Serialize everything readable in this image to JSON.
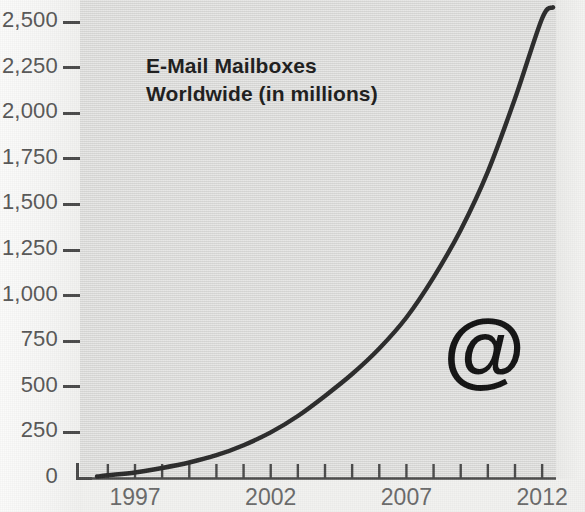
{
  "chart_data": {
    "type": "line",
    "title": "E-Mail Mailboxes Worldwide (in millions)",
    "title_line1": "E-Mail Mailboxes",
    "title_line2": "Worldwide (in millions)",
    "xlabel": "",
    "ylabel": "",
    "ylim": [
      0,
      2500
    ],
    "xlim": [
      1995.6,
      2012.4
    ],
    "grid": false,
    "legend": null,
    "y_ticks": [
      0,
      250,
      500,
      750,
      1000,
      1250,
      1500,
      1750,
      2000,
      2250,
      2500
    ],
    "y_tick_labels": [
      "0",
      "250",
      "500",
      "750",
      "1,000",
      "1,250",
      "1,500",
      "1,750",
      "2,000",
      "2,250",
      "2,500"
    ],
    "x_ticks": [
      1996,
      1997,
      1998,
      1999,
      2000,
      2001,
      2002,
      2003,
      2004,
      2005,
      2006,
      2007,
      2008,
      2009,
      2010,
      2011,
      2012
    ],
    "x_tick_labels": [
      "",
      "1997",
      "",
      "",
      "",
      "",
      "2002",
      "",
      "",
      "",
      "",
      "2007",
      "",
      "",
      "",
      "",
      "2012"
    ],
    "x_labeled": [
      "1997",
      "2002",
      "2007",
      "2012"
    ],
    "series": [
      {
        "name": "E-Mail Mailboxes Worldwide",
        "color": "#2b2b2b",
        "x": [
          1995.6,
          1996,
          1997,
          1998,
          1999,
          2000,
          2001,
          2002,
          2003,
          2004,
          2005,
          2006,
          2007,
          2008,
          2009,
          2010,
          2011,
          2012,
          2012.4
        ],
        "values": [
          8,
          15,
          30,
          55,
          85,
          125,
          180,
          250,
          340,
          450,
          570,
          710,
          880,
          1100,
          1360,
          1680,
          2080,
          2520,
          2580
        ]
      }
    ],
    "annotations": [
      {
        "name": "at-symbol",
        "text": "@",
        "x": 2009.9,
        "y": 640
      }
    ],
    "colors": {
      "line": "#2b2b2b",
      "plot_background": "#dddddb",
      "figure_background": "#f2f2f0",
      "axis": "#4a4a4a",
      "y_label_text": "#575757",
      "x_label_text": "#6a6a6a",
      "title_text": "#1d1d1d"
    }
  }
}
